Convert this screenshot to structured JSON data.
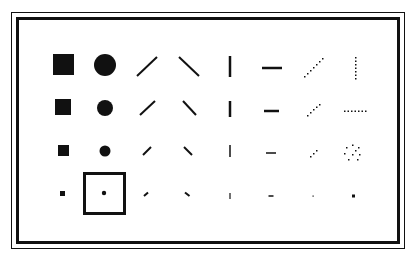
{
  "dialog": {
    "name": "brush-shape-palette",
    "colors": {
      "ink": "#111111",
      "background": "#ffffff"
    },
    "selected": {
      "row": 3,
      "col": 1
    },
    "columns": [
      "square",
      "round",
      "slash",
      "backslash",
      "vertical",
      "horizontal",
      "dotted-diagonal",
      "dotted-line"
    ],
    "rows": [
      {
        "size": "large",
        "brushes": [
          {
            "id": "square-large",
            "shape": "square",
            "icon": "square-brush-icon"
          },
          {
            "id": "round-large",
            "shape": "round",
            "icon": "round-brush-icon"
          },
          {
            "id": "slash-large",
            "shape": "slash",
            "icon": "slash-brush-icon"
          },
          {
            "id": "backslash-large",
            "shape": "backslash",
            "icon": "backslash-brush-icon"
          },
          {
            "id": "vertical-large",
            "shape": "vertical",
            "icon": "vertical-brush-icon"
          },
          {
            "id": "horizontal-large",
            "shape": "horizontal",
            "icon": "horizontal-brush-icon"
          },
          {
            "id": "dotted-diagonal-large",
            "shape": "dotted-diagonal",
            "icon": "dotted-diagonal-brush-icon"
          },
          {
            "id": "dotted-vertical",
            "shape": "dotted-vertical",
            "icon": "dotted-vertical-brush-icon"
          }
        ]
      },
      {
        "size": "medium",
        "brushes": [
          {
            "id": "square-medium",
            "shape": "square",
            "icon": "square-brush-icon"
          },
          {
            "id": "round-medium",
            "shape": "round",
            "icon": "round-brush-icon"
          },
          {
            "id": "slash-medium",
            "shape": "slash",
            "icon": "slash-brush-icon"
          },
          {
            "id": "backslash-medium",
            "shape": "backslash",
            "icon": "backslash-brush-icon"
          },
          {
            "id": "vertical-medium",
            "shape": "vertical",
            "icon": "vertical-brush-icon"
          },
          {
            "id": "horizontal-medium",
            "shape": "horizontal",
            "icon": "horizontal-brush-icon"
          },
          {
            "id": "dotted-diagonal-medium",
            "shape": "dotted-diagonal",
            "icon": "dotted-diagonal-brush-icon"
          },
          {
            "id": "dotted-horizontal",
            "shape": "dotted-horizontal",
            "icon": "dotted-horizontal-brush-icon"
          }
        ]
      },
      {
        "size": "small",
        "brushes": [
          {
            "id": "square-small",
            "shape": "square",
            "icon": "square-brush-icon"
          },
          {
            "id": "round-small",
            "shape": "round",
            "icon": "round-brush-icon"
          },
          {
            "id": "slash-small",
            "shape": "slash",
            "icon": "slash-brush-icon"
          },
          {
            "id": "backslash-small",
            "shape": "backslash",
            "icon": "backslash-brush-icon"
          },
          {
            "id": "vertical-small",
            "shape": "vertical",
            "icon": "vertical-brush-icon"
          },
          {
            "id": "horizontal-small",
            "shape": "horizontal",
            "icon": "horizontal-brush-icon"
          },
          {
            "id": "dotted-diagonal-small",
            "shape": "dotted-diagonal",
            "icon": "dotted-diagonal-brush-icon"
          },
          {
            "id": "spray",
            "shape": "spray",
            "icon": "spray-brush-icon"
          }
        ]
      },
      {
        "size": "tiny",
        "brushes": [
          {
            "id": "square-tiny",
            "shape": "square",
            "icon": "square-brush-icon"
          },
          {
            "id": "round-tiny",
            "shape": "round",
            "icon": "round-brush-icon"
          },
          {
            "id": "slash-tiny",
            "shape": "slash",
            "icon": "slash-brush-icon"
          },
          {
            "id": "backslash-tiny",
            "shape": "backslash",
            "icon": "backslash-brush-icon"
          },
          {
            "id": "vertical-tiny",
            "shape": "vertical",
            "icon": "vertical-brush-icon"
          },
          {
            "id": "horizontal-tiny",
            "shape": "horizontal",
            "icon": "horizontal-brush-icon"
          },
          {
            "id": "dot-tiny",
            "shape": "dot",
            "icon": "dot-brush-icon"
          },
          {
            "id": "square-dot",
            "shape": "square-dot",
            "icon": "square-dot-brush-icon"
          }
        ]
      }
    ]
  }
}
